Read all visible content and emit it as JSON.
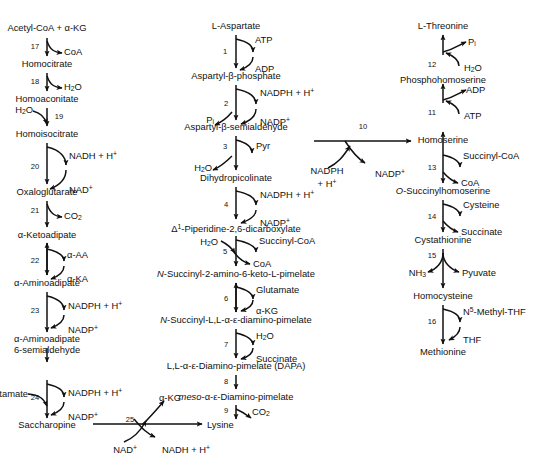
{
  "figure": {
    "type": "biochemical-pathway-diagram",
    "width": 539,
    "height": 471,
    "background_color": "#ffffff",
    "line_color": "#111111"
  },
  "columns": [
    {
      "name": "alpha-aminoadipate-pathway",
      "position": "left",
      "metabolites": [
        "Acetyl-CoA + α-KG",
        "Homocitrate",
        "Homoaconitate",
        "Homoisocitrate",
        "Oxaloglutarate",
        "α-Ketoadipate",
        "α-Aminoadipate",
        "α-Aminoadipate 6-semialdehyde",
        "Saccharopine",
        "Lysine"
      ]
    },
    {
      "name": "diaminopimelate-pathway",
      "position": "middle",
      "metabolites": [
        "L-Aspartate",
        "Aspartyl-β-phosphate",
        "Aspartyl-β-semialdehyde",
        "Dihydropicolinate",
        "Δ¹-Piperidine-2,6-dicarboxylate",
        "N-Succinyl-2-amino-6-keto-L-pimelate",
        "N-Succinyl-L,L-α-ε-diamino-pimelate",
        "L,L-α-ε-Diamino-pimelate (DAPA)",
        "meso-α-ε-Diamino-pimelate",
        "Lysine"
      ]
    },
    {
      "name": "methionine-threonine-pathway",
      "position": "right",
      "metabolites": [
        "L-Threonine",
        "Phosphohomoserine",
        "Homoserine",
        "O-Succinylhomoserine",
        "Cystathionine",
        "Homocysteine",
        "Methionine"
      ]
    }
  ],
  "metabolites": {
    "acetyl_coa_akg": "Acetyl-CoA + α-KG",
    "homocitrate": "Homocitrate",
    "homoaconitate": "Homoaconitate",
    "homoisocitrate": "Homoisocitrate",
    "oxaloglutarate": "Oxaloglutarate",
    "alpha_ketoadipate": "α-Ketoadipate",
    "alpha_aminoadipate": "α-Aminoadipate",
    "alpha_aminoadipate_semialdehyde_l1": "α-Aminoadipate",
    "alpha_aminoadipate_semialdehyde_l2": "6-semialdehyde",
    "saccharopine": "Saccharopine",
    "l_aspartate": "L-Aspartate",
    "aspartyl_b_phosphate": "Aspartyl-β-phosphate",
    "aspartyl_b_semialdehyde": "Aspartyl-β-semialdehyde",
    "dihydropicolinate": "Dihydropicolinate",
    "piperidine_dicarboxylate_pre": "-Piperidine-2,6-dicarboxylate",
    "piperidine_delta": "Δ",
    "piperidine_sup": "1",
    "n_succinyl_keto_pimelate_it": "N",
    "n_succinyl_keto_pimelate_rest": "-Succinyl-2-amino-6-keto-L-pimelate",
    "n_succinyl_diamino_pimelate_it": "N",
    "n_succinyl_diamino_pimelate_rest": "-Succinyl-L,L-α-ε-diamino-pimelate",
    "ll_diamino_pimelate": "L,L-α-ε-Diamino-pimelate (DAPA)",
    "meso_it": "meso",
    "meso_rest": "-α-ε-Diamino-pimelate",
    "lysine": "Lysine",
    "l_threonine": "L-Threonine",
    "phosphohomoserine": "Phosphohomoserine",
    "homoserine": "Homoserine",
    "o_succinylhomoserine_it": "O",
    "o_succinylhomoserine_rest": "-Succinylhomoserine",
    "cystathionine": "Cystathionine",
    "homocysteine": "Homocysteine",
    "methionine": "Methionine"
  },
  "cofactors": {
    "coa_17": "CoA",
    "h2o_18": "H",
    "h2o_18_sub": "2",
    "h2o_18_end": "O",
    "h2o_19": "H",
    "nadh_h_20": "NADH + H",
    "nad_20": "NAD",
    "co2_21": "CO",
    "alpha_aa_22": "α-AA",
    "alpha_ka_22": "α-KA",
    "nadph_h_23": "NADPH + H",
    "nadp_23": "NADP",
    "glutamate_24": "Glutamate",
    "nadph_h_24": "NADPH + H",
    "nadp_24": "NADP",
    "nad_25": "NAD",
    "nadh_h_25": "NADH + H",
    "akg_25": "α-KG",
    "atp_1": "ATP",
    "adp_1": "ADP",
    "pi_2": "P",
    "pi_2_sub": "i",
    "nadph_h_2": "NADPH + H",
    "nadp_2": "NADP",
    "pyr_3": "Pyr",
    "h2o_3": "H",
    "nadph_h_4": "NADPH + H",
    "nadp_4": "NADP",
    "h2o_5": "H",
    "succinyl_coa_5": "Succinyl-CoA",
    "coa_5": "CoA",
    "glutamate_6": "Glutamate",
    "akg_6": "α-KG",
    "h2o_7": "H",
    "succinate_7": "Succinate",
    "co2_9": "CO",
    "nadph_h_10_l1": "NADPH",
    "nadph_h_10_l2": "+ H",
    "nadp_10": "NADP",
    "pi_12": "P",
    "pi_12_sub": "i",
    "h2o_12": "H",
    "adp_11": "ADP",
    "atp_11": "ATP",
    "succinyl_coa_13": "Succinyl-CoA",
    "coa_13": "CoA",
    "cysteine_14": "Cysteine",
    "succinate_14": "Succinate",
    "nh3_15": "NH",
    "nh3_15_sub": "3",
    "pyruvate_15": "Pyuvate",
    "n5_methyl_thf_16_n": "N",
    "n5_methyl_thf_16_sup": "5",
    "n5_methyl_thf_16_rest": "-Methyl-THF",
    "thf_16": "THF",
    "sub_2": "2",
    "plus_charge": "+"
  },
  "enzyme_steps": [
    {
      "id": "1",
      "label": "1"
    },
    {
      "id": "2",
      "label": "2"
    },
    {
      "id": "3",
      "label": "3"
    },
    {
      "id": "4",
      "label": "4"
    },
    {
      "id": "5",
      "label": "5"
    },
    {
      "id": "6",
      "label": "6"
    },
    {
      "id": "7",
      "label": "7"
    },
    {
      "id": "8",
      "label": "8"
    },
    {
      "id": "9",
      "label": "9"
    },
    {
      "id": "10",
      "label": "10"
    },
    {
      "id": "11",
      "label": "11"
    },
    {
      "id": "12",
      "label": "12"
    },
    {
      "id": "13",
      "label": "13"
    },
    {
      "id": "14",
      "label": "14"
    },
    {
      "id": "15",
      "label": "15"
    },
    {
      "id": "16",
      "label": "16"
    },
    {
      "id": "17",
      "label": "17"
    },
    {
      "id": "18",
      "label": "18"
    },
    {
      "id": "19",
      "label": "19"
    },
    {
      "id": "20",
      "label": "20"
    },
    {
      "id": "21",
      "label": "21"
    },
    {
      "id": "22",
      "label": "22"
    },
    {
      "id": "23",
      "label": "23"
    },
    {
      "id": "24",
      "label": "24"
    },
    {
      "id": "25",
      "label": "25"
    }
  ]
}
